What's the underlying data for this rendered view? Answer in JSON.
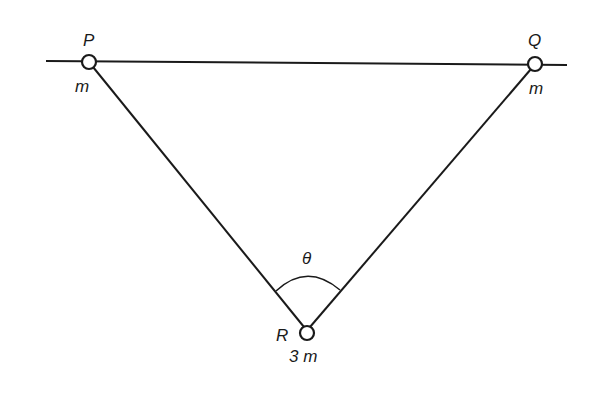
{
  "diagram": {
    "type": "mechanics-rings-on-rod",
    "rod": {
      "label": "horizontal smooth rod"
    },
    "points": [
      {
        "id": "P",
        "label": "P",
        "mass_label": "m"
      },
      {
        "id": "Q",
        "label": "Q",
        "mass_label": "m"
      },
      {
        "id": "R",
        "label": "R",
        "mass_label": "3 m"
      }
    ],
    "angle": {
      "label": "θ",
      "at": "R"
    },
    "colors": {
      "stroke": "#1a1a1a",
      "background": "#ffffff"
    }
  }
}
